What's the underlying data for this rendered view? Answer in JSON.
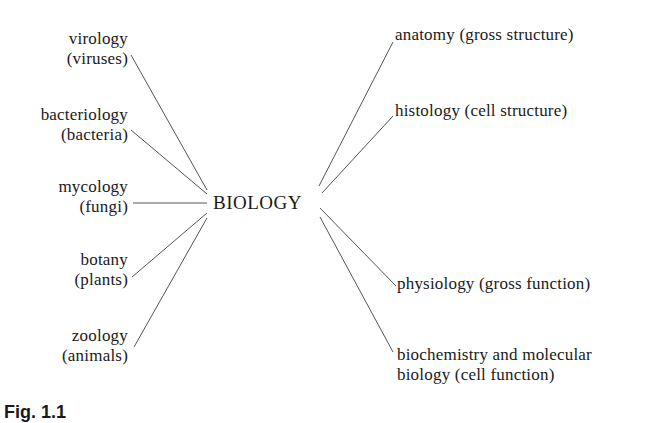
{
  "diagram": {
    "center": "BIOLOGY",
    "left_branches": [
      {
        "line1": "virology",
        "line2": "(viruses)"
      },
      {
        "line1": "bacteriology",
        "line2": "(bacteria)"
      },
      {
        "line1": "mycology",
        "line2": "(fungi)"
      },
      {
        "line1": "botany",
        "line2": "(plants)"
      },
      {
        "line1": "zoology",
        "line2": "(animals)"
      }
    ],
    "right_branches": [
      {
        "line1": "anatomy (gross structure)"
      },
      {
        "line1": "histology (cell structure)"
      },
      {
        "line1": "physiology (gross function)"
      },
      {
        "line1": "biochemistry and molecular",
        "line2": "biology (cell function)"
      }
    ],
    "caption": "Fig. 1.1"
  }
}
